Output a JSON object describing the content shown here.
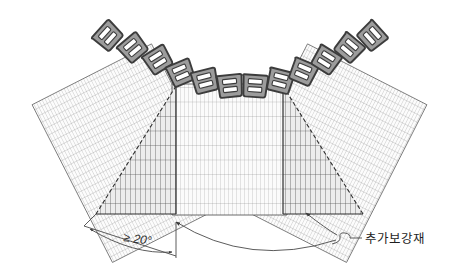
{
  "diagram": {
    "type": "engineering-plan-view",
    "background_color": "#ffffff",
    "line_color": "#3a3a3a",
    "grid_color": "#9a9a9a",
    "grid_color_dark": "#4a4a4a",
    "block_fill": "#9c9c9c",
    "block_stroke": "#3c3c3c",
    "block_slot_fill": "#ffffff",
    "wedge_fill": "#d8d8d8",
    "panel_fill": "#fbfbfb"
  },
  "annotations": {
    "angle_label": "≥ 20°",
    "reinforcement_label": "추가보강재"
  },
  "labels": [
    {
      "name": "angle-dimension",
      "text": "≥ 20°",
      "x": 137,
      "y": 243
    },
    {
      "name": "reinforcement-callout",
      "text": "추가보강재",
      "x": 363,
      "y": 243
    }
  ],
  "panels": {
    "left": {
      "name": "left-fan-panel",
      "rotation_deg": -28,
      "columns": 44,
      "rows": 20
    },
    "center": {
      "name": "center-panel",
      "rotation_deg": 0,
      "columns": 38,
      "rows": 9
    },
    "right": {
      "name": "right-fan-panel",
      "rotation_deg": 28,
      "columns": 44,
      "rows": 20
    }
  },
  "wedges": {
    "left": {
      "name": "left-reinforcement-wedge",
      "columns": 22,
      "rows": 9
    },
    "right": {
      "name": "right-reinforcement-wedge",
      "columns": 22,
      "rows": 9
    }
  },
  "blocks": {
    "name": "facing-block-row",
    "count": 13,
    "slots_per_block": 2,
    "arc_angles_deg": [
      -62,
      -52,
      -42,
      -32,
      -22,
      -11,
      0,
      11,
      22,
      32,
      42,
      52,
      62
    ]
  }
}
